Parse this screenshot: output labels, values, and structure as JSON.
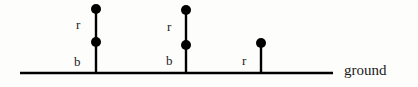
{
  "figure": {
    "background_color": "#fdfdfc",
    "stroke_color": "#000000",
    "text_color": "#1a1a1a",
    "width": 418,
    "height": 87
  },
  "ground": {
    "caption": "ground",
    "line": {
      "x1": 20,
      "y1": 73,
      "x2": 333,
      "y2": 73,
      "thickness": 2.5
    }
  },
  "poles": [
    {
      "id": "pole-1",
      "x": 96,
      "base_y": 73,
      "top_y": 9,
      "nodes": [
        {
          "id": "pole-1-node-top",
          "x": 96,
          "y": 9,
          "radius": 5
        },
        {
          "id": "pole-1-node-middle",
          "x": 96,
          "y": 42,
          "radius": 5
        }
      ],
      "labels": [
        {
          "id": "pole-1-label-upper",
          "text": "r",
          "x": 76,
          "y": 18
        },
        {
          "id": "pole-1-label-lower",
          "text": "b",
          "x": 74,
          "y": 55
        }
      ]
    },
    {
      "id": "pole-2",
      "x": 186,
      "base_y": 73,
      "top_y": 10,
      "nodes": [
        {
          "id": "pole-2-node-top",
          "x": 186,
          "y": 10,
          "radius": 5
        },
        {
          "id": "pole-2-node-middle",
          "x": 186,
          "y": 45,
          "radius": 5
        }
      ],
      "labels": [
        {
          "id": "pole-2-label-upper",
          "text": "r",
          "x": 167,
          "y": 20
        },
        {
          "id": "pole-2-label-lower",
          "text": "b",
          "x": 166,
          "y": 54
        }
      ]
    },
    {
      "id": "pole-3",
      "x": 261,
      "base_y": 73,
      "top_y": 43,
      "nodes": [
        {
          "id": "pole-3-node-top",
          "x": 261,
          "y": 43,
          "radius": 5
        }
      ],
      "labels": [
        {
          "id": "pole-3-label-upper",
          "text": "r",
          "x": 242,
          "y": 54
        }
      ]
    }
  ]
}
